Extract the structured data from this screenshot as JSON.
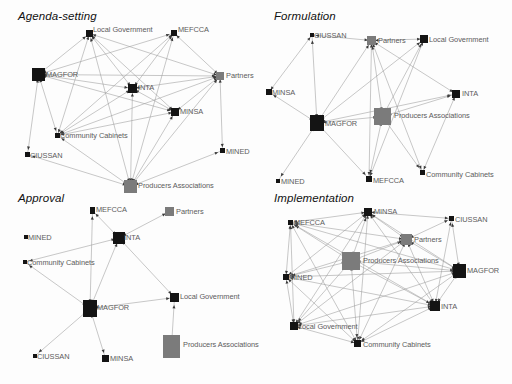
{
  "figure": {
    "background": "#fdfdfd",
    "node_colors": {
      "dark": "#141414",
      "gray": "#7b7b7b"
    },
    "edge_color": "#9a9a9a",
    "label_color": "#5c5c5c",
    "width": 512,
    "height": 384
  },
  "chart_data": {
    "type": "diagram",
    "subtype": "social-network-graph-panels",
    "actor_names": [
      "MAGFOR",
      "INTA",
      "MINSA",
      "MINED",
      "MEFCCA",
      "CIUSSAN",
      "Partners",
      "Producers Associations",
      "Local Government",
      "Community Cabinets"
    ],
    "panels": [
      {
        "id": "agenda-setting",
        "title": "Agenda-setting",
        "title_pos": {
          "x": 18,
          "y": 10
        },
        "origin": {
          "x": 0,
          "y": 0
        },
        "size": {
          "w": 256,
          "h": 192
        },
        "nodes": [
          {
            "id": "LG",
            "label": "Local Government",
            "x": 86,
            "y": 30,
            "w": 7,
            "h": 7,
            "color": "dark",
            "lx": 93,
            "ly": 26
          },
          {
            "id": "MEF",
            "label": "MEFCCA",
            "x": 171,
            "y": 30,
            "w": 6,
            "h": 6,
            "color": "dark",
            "lx": 178,
            "ly": 26
          },
          {
            "id": "MAG",
            "label": "MAGFOR",
            "x": 32,
            "y": 68,
            "w": 13,
            "h": 13,
            "color": "dark",
            "lx": 46,
            "ly": 71
          },
          {
            "id": "PAR",
            "label": "Partners",
            "x": 216,
            "y": 72,
            "w": 8,
            "h": 8,
            "color": "gray",
            "lx": 226,
            "ly": 72
          },
          {
            "id": "INT",
            "label": "INTA",
            "x": 128,
            "y": 84,
            "w": 9,
            "h": 9,
            "color": "dark",
            "lx": 138,
            "ly": 84
          },
          {
            "id": "MIN",
            "label": "MINSA",
            "x": 171,
            "y": 108,
            "w": 8,
            "h": 8,
            "color": "dark",
            "lx": 180,
            "ly": 108
          },
          {
            "id": "CC",
            "label": "Community Cabinets",
            "x": 55,
            "y": 133,
            "w": 5,
            "h": 5,
            "color": "dark",
            "lx": 60,
            "ly": 132
          },
          {
            "id": "MED",
            "label": "MINED",
            "x": 220,
            "y": 148,
            "w": 5,
            "h": 5,
            "color": "dark",
            "lx": 226,
            "ly": 148
          },
          {
            "id": "CIU",
            "label": "CIUSSAN",
            "x": 25,
            "y": 152,
            "w": 5,
            "h": 5,
            "color": "dark",
            "lx": 30,
            "ly": 152
          },
          {
            "id": "PA",
            "label": "Producers Associations",
            "x": 124,
            "y": 180,
            "w": 13,
            "h": 13,
            "color": "gray",
            "lx": 138,
            "ly": 182
          }
        ],
        "edges": [
          [
            "MAG",
            "LG"
          ],
          [
            "MAG",
            "INT"
          ],
          [
            "MAG",
            "PAR"
          ],
          [
            "MAG",
            "CIU"
          ],
          [
            "MAG",
            "MIN"
          ],
          [
            "MAG",
            "CC"
          ],
          [
            "MAG",
            "MEF"
          ],
          [
            "LG",
            "INT"
          ],
          [
            "LG",
            "PAR"
          ],
          [
            "LG",
            "MIN"
          ],
          [
            "LG",
            "PA"
          ],
          [
            "LG",
            "CC"
          ],
          [
            "MEF",
            "PAR"
          ],
          [
            "MEF",
            "INT"
          ],
          [
            "MEF",
            "CC"
          ],
          [
            "MEF",
            "PA"
          ],
          [
            "PAR",
            "INT"
          ],
          [
            "PAR",
            "MIN"
          ],
          [
            "PAR",
            "MED"
          ],
          [
            "PAR",
            "PA"
          ],
          [
            "PAR",
            "CC"
          ],
          [
            "INT",
            "PA"
          ],
          [
            "INT",
            "MIN"
          ],
          [
            "INT",
            "CC"
          ],
          [
            "MIN",
            "PA"
          ],
          [
            "MIN",
            "CC"
          ],
          [
            "CIU",
            "PA"
          ],
          [
            "CC",
            "PA"
          ],
          [
            "MED",
            "PA"
          ]
        ]
      },
      {
        "id": "formulation",
        "title": "Formulation",
        "title_pos": {
          "x": 274,
          "y": 10
        },
        "origin": {
          "x": 256,
          "y": 0
        },
        "size": {
          "w": 256,
          "h": 192
        },
        "nodes": [
          {
            "id": "CIU",
            "label": "CIUSSAN",
            "x": 54,
            "y": 33,
            "w": 4,
            "h": 4,
            "color": "dark",
            "lx": 58,
            "ly": 32
          },
          {
            "id": "PAR",
            "label": "Partners",
            "x": 111,
            "y": 36,
            "w": 9,
            "h": 9,
            "color": "gray",
            "lx": 122,
            "ly": 37
          },
          {
            "id": "LG",
            "label": "Local Government",
            "x": 164,
            "y": 35,
            "w": 8,
            "h": 8,
            "color": "dark",
            "lx": 173,
            "ly": 36
          },
          {
            "id": "MIN",
            "label": "MINSA",
            "x": 10,
            "y": 89,
            "w": 6,
            "h": 6,
            "color": "dark",
            "lx": 16,
            "ly": 89
          },
          {
            "id": "INT",
            "label": "INTA",
            "x": 196,
            "y": 90,
            "w": 8,
            "h": 8,
            "color": "dark",
            "lx": 206,
            "ly": 90
          },
          {
            "id": "PA",
            "label": "Producers Associations",
            "x": 118,
            "y": 108,
            "w": 17,
            "h": 17,
            "color": "gray",
            "lx": 138,
            "ly": 112
          },
          {
            "id": "MAG",
            "label": "MAGFOR",
            "x": 54,
            "y": 115,
            "w": 14,
            "h": 16,
            "color": "dark",
            "lx": 69,
            "ly": 120
          },
          {
            "id": "MED",
            "label": "MINED",
            "x": 20,
            "y": 179,
            "w": 4,
            "h": 4,
            "color": "dark",
            "lx": 25,
            "ly": 178
          },
          {
            "id": "MEF",
            "label": "MEFCCA",
            "x": 110,
            "y": 176,
            "w": 6,
            "h": 6,
            "color": "dark",
            "lx": 117,
            "ly": 177
          },
          {
            "id": "CC",
            "label": "Community Cabinets",
            "x": 164,
            "y": 170,
            "w": 5,
            "h": 5,
            "color": "dark",
            "lx": 170,
            "ly": 171
          }
        ],
        "edges": [
          [
            "CIU",
            "PAR"
          ],
          [
            "CIU",
            "MAG"
          ],
          [
            "CIU",
            "MIN"
          ],
          [
            "PAR",
            "LG"
          ],
          [
            "PAR",
            "MAG"
          ],
          [
            "PAR",
            "PA"
          ],
          [
            "PAR",
            "MEF"
          ],
          [
            "PAR",
            "INT"
          ],
          [
            "PAR",
            "CC"
          ],
          [
            "MAG",
            "MIN"
          ],
          [
            "MAG",
            "PA"
          ],
          [
            "MAG",
            "MED"
          ],
          [
            "MAG",
            "MEF"
          ],
          [
            "MAG",
            "INT"
          ],
          [
            "MAG",
            "LG"
          ],
          [
            "PA",
            "INT"
          ],
          [
            "PA",
            "MEF"
          ],
          [
            "PA",
            "CC"
          ],
          [
            "PA",
            "LG"
          ],
          [
            "LG",
            "MEF"
          ],
          [
            "INT",
            "CC"
          ]
        ]
      },
      {
        "id": "approval",
        "title": "Approval",
        "title_pos": {
          "x": 18,
          "y": 192
        },
        "origin": {
          "x": 0,
          "y": 192
        },
        "size": {
          "w": 256,
          "h": 192
        },
        "nodes": [
          {
            "id": "MEF",
            "label": "MEFCCA",
            "x": 90,
            "y": 15,
            "w": 5,
            "h": 7,
            "color": "dark",
            "lx": 96,
            "ly": 14
          },
          {
            "id": "PAR",
            "label": "Partners",
            "x": 165,
            "y": 15,
            "w": 9,
            "h": 9,
            "color": "gray",
            "lx": 176,
            "ly": 16
          },
          {
            "id": "INT",
            "label": "INTA",
            "x": 113,
            "y": 40,
            "w": 12,
            "h": 12,
            "color": "dark",
            "lx": 124,
            "ly": 42
          },
          {
            "id": "MED",
            "label": "MINED",
            "x": 24,
            "y": 43,
            "w": 4,
            "h": 4,
            "color": "dark",
            "lx": 28,
            "ly": 42
          },
          {
            "id": "CC",
            "label": "Community Cabinets",
            "x": 23,
            "y": 68,
            "w": 4,
            "h": 4,
            "color": "dark",
            "lx": 27,
            "ly": 67
          },
          {
            "id": "LG",
            "label": "Local Government",
            "x": 170,
            "y": 101,
            "w": 9,
            "h": 9,
            "color": "dark",
            "lx": 180,
            "ly": 101
          },
          {
            "id": "MAG",
            "label": "MAGFOR",
            "x": 83,
            "y": 108,
            "w": 14,
            "h": 17,
            "color": "dark",
            "lx": 97,
            "ly": 112
          },
          {
            "id": "PA",
            "label": "Producers Associations",
            "x": 163,
            "y": 143,
            "w": 17,
            "h": 23,
            "color": "gray",
            "lx": 183,
            "ly": 149
          },
          {
            "id": "CIU",
            "label": "CIUSSAN",
            "x": 33,
            "y": 162,
            "w": 4,
            "h": 4,
            "color": "dark",
            "lx": 37,
            "ly": 161
          },
          {
            "id": "MIN",
            "label": "MINSA",
            "x": 102,
            "y": 163,
            "w": 7,
            "h": 7,
            "color": "dark",
            "lx": 110,
            "ly": 163
          }
        ],
        "edges": [
          [
            "MEF",
            "INT"
          ],
          [
            "PAR",
            "INT"
          ],
          [
            "CC",
            "INT"
          ],
          [
            "INT",
            "MAG"
          ],
          [
            "INT",
            "LG"
          ],
          [
            "MEF",
            "MAG"
          ],
          [
            "CC",
            "MAG"
          ],
          [
            "MAG",
            "LG"
          ],
          [
            "MAG",
            "CIU"
          ],
          [
            "MAG",
            "MIN"
          ],
          [
            "LG",
            "PA"
          ]
        ]
      },
      {
        "id": "implementation",
        "title": "Implementation",
        "title_pos": {
          "x": 274,
          "y": 192
        },
        "origin": {
          "x": 256,
          "y": 192
        },
        "size": {
          "w": 256,
          "h": 192
        },
        "nodes": [
          {
            "id": "MIN",
            "label": "MINSA",
            "x": 108,
            "y": 16,
            "w": 8,
            "h": 8,
            "color": "dark",
            "lx": 118,
            "ly": 16
          },
          {
            "id": "MEF",
            "label": "MEFCCA",
            "x": 32,
            "y": 28,
            "w": 5,
            "h": 5,
            "color": "dark",
            "lx": 38,
            "ly": 27
          },
          {
            "id": "CIU",
            "label": "CIUSSAN",
            "x": 193,
            "y": 24,
            "w": 5,
            "h": 5,
            "color": "dark",
            "lx": 199,
            "ly": 24
          },
          {
            "id": "PAR",
            "label": "Partners",
            "x": 145,
            "y": 42,
            "w": 11,
            "h": 11,
            "color": "gray",
            "lx": 158,
            "ly": 44
          },
          {
            "id": "PA",
            "label": "Producers Associations",
            "x": 86,
            "y": 60,
            "w": 18,
            "h": 18,
            "color": "gray",
            "lx": 107,
            "ly": 65
          },
          {
            "id": "MAG",
            "label": "MAGFOR",
            "x": 197,
            "y": 72,
            "w": 13,
            "h": 14,
            "color": "dark",
            "lx": 211,
            "ly": 75
          },
          {
            "id": "MED",
            "label": "MINED",
            "x": 27,
            "y": 82,
            "w": 6,
            "h": 6,
            "color": "dark",
            "lx": 33,
            "ly": 82
          },
          {
            "id": "INT",
            "label": "INTA",
            "x": 174,
            "y": 109,
            "w": 10,
            "h": 10,
            "color": "dark",
            "lx": 185,
            "ly": 111
          },
          {
            "id": "LG",
            "label": "Local Government",
            "x": 34,
            "y": 130,
            "w": 8,
            "h": 8,
            "color": "dark",
            "lx": 42,
            "ly": 131
          },
          {
            "id": "CC",
            "label": "Community Cabinets",
            "x": 98,
            "y": 148,
            "w": 7,
            "h": 7,
            "color": "dark",
            "lx": 107,
            "ly": 149
          }
        ],
        "edges": [
          [
            "MIN",
            "MEF"
          ],
          [
            "MIN",
            "CIU"
          ],
          [
            "MIN",
            "PAR"
          ],
          [
            "MIN",
            "PA"
          ],
          [
            "MIN",
            "MAG"
          ],
          [
            "MIN",
            "MED"
          ],
          [
            "MIN",
            "INT"
          ],
          [
            "MIN",
            "LG"
          ],
          [
            "MIN",
            "CC"
          ],
          [
            "MEF",
            "PAR"
          ],
          [
            "MEF",
            "PA"
          ],
          [
            "MEF",
            "MAG"
          ],
          [
            "MEF",
            "MED"
          ],
          [
            "MEF",
            "INT"
          ],
          [
            "MEF",
            "LG"
          ],
          [
            "MEF",
            "CC"
          ],
          [
            "CIU",
            "PAR"
          ],
          [
            "CIU",
            "MAG"
          ],
          [
            "CIU",
            "INT"
          ],
          [
            "PAR",
            "PA"
          ],
          [
            "PAR",
            "MAG"
          ],
          [
            "PAR",
            "MED"
          ],
          [
            "PAR",
            "INT"
          ],
          [
            "PAR",
            "LG"
          ],
          [
            "PAR",
            "CC"
          ],
          [
            "PA",
            "MAG"
          ],
          [
            "PA",
            "MED"
          ],
          [
            "PA",
            "INT"
          ],
          [
            "PA",
            "LG"
          ],
          [
            "PA",
            "CC"
          ],
          [
            "MAG",
            "MED"
          ],
          [
            "MAG",
            "INT"
          ],
          [
            "MAG",
            "LG"
          ],
          [
            "MAG",
            "CC"
          ],
          [
            "MED",
            "INT"
          ],
          [
            "MED",
            "LG"
          ],
          [
            "MED",
            "CC"
          ],
          [
            "INT",
            "LG"
          ],
          [
            "INT",
            "CC"
          ],
          [
            "LG",
            "CC"
          ]
        ]
      }
    ]
  }
}
